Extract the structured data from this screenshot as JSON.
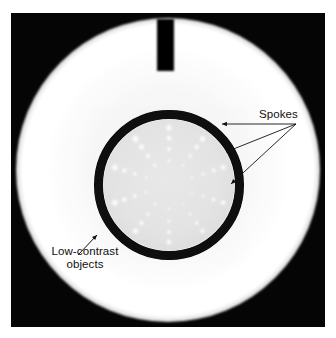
{
  "figure": {
    "kind": "ct-phantom-scan",
    "background_color": "#ffffff",
    "scan_background_color": "#050505"
  },
  "scan": {
    "plate": {
      "x": 11,
      "y": 13,
      "width": 314,
      "height": 314
    },
    "outer_disk": {
      "name": "phantom-body",
      "center_x": 157,
      "center_y": 157,
      "radius": 152,
      "color": "#ffffff"
    },
    "top_marker": {
      "name": "orientation-marker",
      "x": 146,
      "y": 8,
      "width": 17,
      "height": 54,
      "color": "#060606"
    },
    "inner_ring": {
      "name": "low-contrast-module-ring",
      "center_x": 158,
      "center_y": 172,
      "radius": 71,
      "thickness": 9,
      "color": "#070707"
    },
    "inner_disk": {
      "name": "low-contrast-module",
      "center_x": 158,
      "center_y": 172,
      "radius": 66,
      "color": "#e6e6e6"
    },
    "object_color": "#fbfbfb",
    "spoke_count": 10,
    "spokes": [
      {
        "angle_deg": -72,
        "objects": [
          {
            "r": 24,
            "d": 3.0
          },
          {
            "r": 36,
            "d": 4.0
          },
          {
            "r": 47,
            "d": 5.0
          },
          {
            "r": 57,
            "d": 6.5
          }
        ]
      },
      {
        "angle_deg": -36,
        "objects": [
          {
            "r": 24,
            "d": 3.4
          },
          {
            "r": 36,
            "d": 4.6
          },
          {
            "r": 47,
            "d": 5.6
          },
          {
            "r": 57,
            "d": 7.0
          }
        ]
      },
      {
        "angle_deg": 0,
        "objects": [
          {
            "r": 24,
            "d": 3.2
          },
          {
            "r": 36,
            "d": 4.2
          },
          {
            "r": 47,
            "d": 5.2
          },
          {
            "r": 57,
            "d": 6.2
          }
        ]
      },
      {
        "angle_deg": 36,
        "objects": [
          {
            "r": 24,
            "d": 2.8
          },
          {
            "r": 36,
            "d": 3.8
          },
          {
            "r": 47,
            "d": 4.8
          },
          {
            "r": 57,
            "d": 6.0
          }
        ]
      },
      {
        "angle_deg": 72,
        "objects": [
          {
            "r": 24,
            "d": 2.6
          },
          {
            "r": 36,
            "d": 3.4
          },
          {
            "r": 47,
            "d": 4.4
          },
          {
            "r": 57,
            "d": 5.4
          }
        ]
      },
      {
        "angle_deg": 108,
        "objects": [
          {
            "r": 24,
            "d": 2.4
          },
          {
            "r": 36,
            "d": 3.2
          },
          {
            "r": 47,
            "d": 4.0
          },
          {
            "r": 57,
            "d": 5.0
          }
        ]
      },
      {
        "angle_deg": 144,
        "objects": [
          {
            "r": 24,
            "d": 2.2
          },
          {
            "r": 36,
            "d": 3.0
          },
          {
            "r": 47,
            "d": 3.8
          },
          {
            "r": 57,
            "d": 4.6
          }
        ]
      },
      {
        "angle_deg": 180,
        "objects": [
          {
            "r": 24,
            "d": 2.4
          },
          {
            "r": 36,
            "d": 3.2
          },
          {
            "r": 47,
            "d": 4.2
          },
          {
            "r": 57,
            "d": 5.2
          }
        ]
      },
      {
        "angle_deg": 216,
        "objects": [
          {
            "r": 24,
            "d": 2.8
          },
          {
            "r": 36,
            "d": 3.6
          },
          {
            "r": 47,
            "d": 4.6
          },
          {
            "r": 57,
            "d": 5.8
          }
        ]
      },
      {
        "angle_deg": 252,
        "objects": [
          {
            "r": 24,
            "d": 3.0
          },
          {
            "r": 36,
            "d": 4.2
          },
          {
            "r": 47,
            "d": 5.0
          },
          {
            "r": 57,
            "d": 6.4
          }
        ]
      }
    ]
  },
  "annotations": {
    "spokes": {
      "label": "Spokes",
      "leader_color": "#111111",
      "leaders": [
        {
          "from_x": 296,
          "from_y": 124,
          "to_x": 222,
          "to_y": 124
        },
        {
          "from_x": 296,
          "from_y": 124,
          "to_x": 226,
          "to_y": 152
        },
        {
          "from_x": 296,
          "from_y": 124,
          "to_x": 231,
          "to_y": 184
        }
      ]
    },
    "low_contrast": {
      "label_line1": "Low-contrast",
      "label_line2": "objects",
      "leader_color": "#111111",
      "arrow": {
        "from_x": 78,
        "from_y": 255,
        "to_x": 97,
        "to_y": 235
      }
    }
  }
}
